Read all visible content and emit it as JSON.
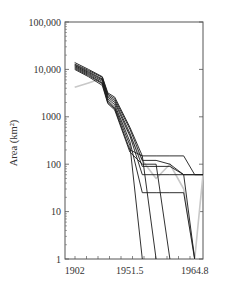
{
  "chart_data": {
    "type": "line",
    "title": "",
    "xlabel": "",
    "ylabel": "Area (km²)",
    "yscale": "log",
    "ylim": [
      1,
      100000
    ],
    "xlim": [
      1902,
      1964.8
    ],
    "grid": false,
    "legend": null,
    "y_ticks": [
      {
        "value": 100000,
        "label": "100,000"
      },
      {
        "value": 10000,
        "label": "10,000"
      },
      {
        "value": 1000,
        "label": "1000"
      },
      {
        "value": 100,
        "label": "100"
      },
      {
        "value": 10,
        "label": "10"
      },
      {
        "value": 1,
        "label": "1"
      }
    ],
    "x_tick_labels": [
      {
        "pos": 0.07,
        "label": "1902"
      },
      {
        "pos": 0.47,
        "label": "1951.5"
      },
      {
        "pos": 0.94,
        "label": "1964.8"
      }
    ],
    "x": [
      0.07,
      0.17,
      0.27,
      0.31,
      0.36,
      0.47,
      0.56,
      0.66,
      0.76,
      0.86,
      0.94,
      1.0
    ],
    "series": [
      {
        "name": "trajectory-1",
        "color": "#1a1a1a",
        "values": [
          14000,
          10000,
          7000,
          3200,
          2600,
          600,
          150,
          150,
          150,
          150,
          60,
          60
        ]
      },
      {
        "name": "trajectory-2",
        "color": "#1a1a1a",
        "values": [
          13000,
          9500,
          6800,
          3000,
          2400,
          550,
          120,
          120,
          100,
          60,
          60,
          60
        ]
      },
      {
        "name": "trajectory-3",
        "color": "#1a1a1a",
        "values": [
          12500,
          9000,
          6300,
          2800,
          2200,
          450,
          90,
          90,
          90,
          60,
          60,
          60
        ]
      },
      {
        "name": "trajectory-4",
        "color": "#1a1a1a",
        "values": [
          12000,
          8600,
          6000,
          2600,
          2000,
          400,
          60,
          60,
          60,
          60,
          1,
          null
        ]
      },
      {
        "name": "trajectory-5",
        "color": "#1a1a1a",
        "values": [
          11500,
          8200,
          5600,
          2400,
          1800,
          300,
          25,
          25,
          25,
          25,
          1,
          null
        ]
      },
      {
        "name": "trajectory-6",
        "color": "#1a1a1a",
        "values": [
          11000,
          7800,
          5200,
          2200,
          1600,
          250,
          1,
          null,
          null,
          null,
          null,
          null
        ]
      },
      {
        "name": "trajectory-7",
        "color": "#1a1a1a",
        "values": [
          10500,
          7400,
          5000,
          2000,
          1500,
          200,
          150,
          1,
          null,
          null,
          null,
          null
        ]
      },
      {
        "name": "trajectory-8",
        "color": "#1a1a1a",
        "values": [
          10000,
          7000,
          4600,
          1900,
          1400,
          180,
          100,
          100,
          1,
          null,
          null,
          null
        ]
      },
      {
        "name": "trajectory-observed",
        "color": "#c8c8c8",
        "values": [
          4200,
          5200,
          6500,
          2100,
          1500,
          400,
          120,
          50,
          100,
          30,
          1,
          60
        ]
      }
    ]
  }
}
